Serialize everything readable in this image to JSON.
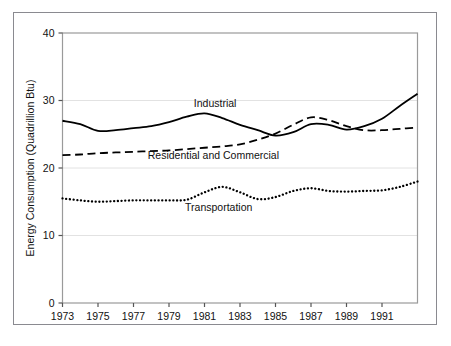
{
  "chart_data": {
    "type": "line",
    "title": "",
    "xlabel": "",
    "ylabel": "Energy Consumption (Quadrillion Btu)",
    "xlim": [
      1973,
      1993
    ],
    "ylim": [
      0,
      40
    ],
    "yticks": [
      0,
      10,
      20,
      30,
      40
    ],
    "ytick_labels": [
      "0",
      "10",
      "20",
      "30",
      "40"
    ],
    "xticks": [
      1973,
      1975,
      1977,
      1979,
      1981,
      1983,
      1985,
      1987,
      1989,
      1991
    ],
    "xtick_labels": [
      "1973",
      "1975",
      "1977",
      "1979",
      "1981",
      "1983",
      "1985",
      "1987",
      "1989",
      "1991"
    ],
    "grid": "horizontal-faint",
    "legend_position": "inline-annotations",
    "x": [
      1973,
      1974,
      1975,
      1976,
      1977,
      1978,
      1979,
      1980,
      1981,
      1982,
      1983,
      1984,
      1985,
      1986,
      1987,
      1988,
      1989,
      1990,
      1991,
      1992,
      1993
    ],
    "series": [
      {
        "name": "Industrial",
        "style": "solid",
        "color": "#000000",
        "label_x": 1981.6,
        "label_y": 29.1,
        "values": [
          27.0,
          26.5,
          25.5,
          25.6,
          25.9,
          26.2,
          26.8,
          27.6,
          28.1,
          27.4,
          26.4,
          25.6,
          24.8,
          25.3,
          26.5,
          26.4,
          25.7,
          26.2,
          27.3,
          29.2,
          31.0
        ]
      },
      {
        "name": "Residential and Commercial",
        "style": "dashed",
        "color": "#000000",
        "label_x": 1981.5,
        "label_y": 21.3,
        "values": [
          21.9,
          22.0,
          22.2,
          22.3,
          22.4,
          22.5,
          22.6,
          22.8,
          23.0,
          23.2,
          23.5,
          24.2,
          25.1,
          26.4,
          27.5,
          27.1,
          26.2,
          25.6,
          25.6,
          25.8,
          26.0
        ]
      },
      {
        "name": "Transportation",
        "style": "dotted",
        "color": "#000000",
        "label_x": 1981.8,
        "label_y": 13.6,
        "values": [
          15.5,
          15.2,
          15.0,
          15.1,
          15.2,
          15.2,
          15.2,
          15.3,
          16.4,
          17.2,
          16.4,
          15.4,
          15.7,
          16.6,
          17.0,
          16.6,
          16.5,
          16.6,
          16.7,
          17.2,
          18.0
        ]
      }
    ]
  }
}
